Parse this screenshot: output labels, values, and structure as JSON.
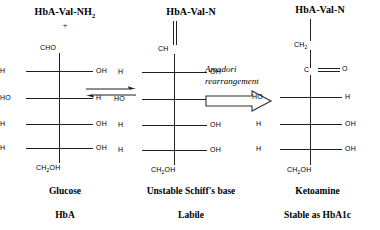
{
  "figure": {
    "type": "chemical-reaction-diagram",
    "background_color": "#ffffff",
    "stroke_color": "#202020"
  },
  "columns": [
    {
      "id": "glucose",
      "top_label": "HbA-Val-NH",
      "top_label_sub": "2",
      "plus_sign": "+",
      "terminal_top": "CHO",
      "terminal_bottom": "CH",
      "terminal_bottom_sub": "2",
      "terminal_bottom_tail": "OH",
      "rows": [
        {
          "left": "H",
          "right": "OH"
        },
        {
          "left": "HO",
          "right": "H"
        },
        {
          "left": "H",
          "right": "OH"
        },
        {
          "left": "H",
          "right": "OH"
        }
      ],
      "caption_1": "Glucose",
      "caption_2": "HbA"
    },
    {
      "id": "schiffs-base",
      "top_label": "HbA-Val-N",
      "top_label_sub": "",
      "plus_sign": "",
      "terminal_top": "CH",
      "terminal_bottom": "CH",
      "terminal_bottom_sub": "2",
      "terminal_bottom_tail": "OH",
      "bond_to_top": "double",
      "rows": [
        {
          "left": "H",
          "right": "OH"
        },
        {
          "left": "HO",
          "right": "H"
        },
        {
          "left": "H",
          "right": "OH"
        },
        {
          "left": "H",
          "right": "OH"
        }
      ],
      "caption_1": "Unstable Schiff's base",
      "caption_2": "Labile"
    },
    {
      "id": "ketoamine",
      "top_label": "HbA-Val-N",
      "top_label_sub": "",
      "plus_sign": "",
      "terminal_top": "CH",
      "terminal_top_sub": "2",
      "carbonyl_carbon": "C",
      "carbonyl_oxygen": "O",
      "terminal_bottom": "CH",
      "terminal_bottom_sub": "2",
      "terminal_bottom_tail": "OH",
      "bond_to_top": "single",
      "rows": [
        {
          "left": "HO",
          "right": "H"
        },
        {
          "left": "H",
          "right": "OH"
        },
        {
          "left": "H",
          "right": "OH"
        }
      ],
      "caption_1": "Ketoamine",
      "caption_2": "Stable as HbA1c"
    }
  ],
  "arrows": {
    "equilibrium": {
      "symbol": "equilibrium-double-arrow",
      "direction": "reversible"
    },
    "transformation": {
      "label_line_1": "Amadori",
      "label_line_2": "rearrangement",
      "symbol": "block-arrow-right",
      "direction": "right"
    }
  }
}
